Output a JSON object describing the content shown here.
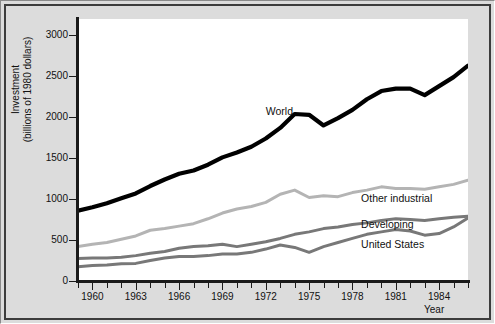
{
  "chart_data": {
    "type": "line",
    "title": "",
    "xlabel": "Year",
    "ylabel": "Investment\n(billions of 1980 dollars)",
    "xlim": [
      1959,
      1986
    ],
    "ylim": [
      0,
      3200
    ],
    "grid": false,
    "legend_position": "inline-right",
    "ytick_labels": [
      "3000",
      "2500",
      "2000",
      "1500",
      "1000",
      "500",
      "0"
    ],
    "ytick_values": [
      3000,
      2500,
      2000,
      1500,
      1000,
      500,
      0
    ],
    "xtick_labels": [
      "1960",
      "1963",
      "1966",
      "1969",
      "1972",
      "1975",
      "1978",
      "1981",
      "1984"
    ],
    "xtick_values": [
      1960,
      1963,
      1966,
      1969,
      1972,
      1975,
      1978,
      1981,
      1984
    ],
    "x": [
      1959,
      1960,
      1961,
      1962,
      1963,
      1964,
      1965,
      1966,
      1967,
      1968,
      1969,
      1970,
      1971,
      1972,
      1973,
      1974,
      1975,
      1976,
      1977,
      1978,
      1979,
      1980,
      1981,
      1982,
      1983,
      1984,
      1985,
      1986
    ],
    "series": [
      {
        "name": "World",
        "color": "#000000",
        "width": 4.2,
        "values": [
          860,
          900,
          950,
          1010,
          1070,
          1160,
          1240,
          1310,
          1350,
          1420,
          1510,
          1570,
          1640,
          1740,
          1870,
          2040,
          2030,
          1900,
          1990,
          2090,
          2220,
          2320,
          2350,
          2350,
          2270,
          2380,
          2490,
          2630
        ]
      },
      {
        "name": "Other industrial",
        "color": "#b4b4b4",
        "width": 3.0,
        "values": [
          420,
          450,
          470,
          510,
          550,
          620,
          640,
          670,
          700,
          760,
          830,
          880,
          910,
          960,
          1060,
          1110,
          1020,
          1040,
          1030,
          1080,
          1110,
          1150,
          1130,
          1130,
          1120,
          1150,
          1180,
          1230
        ]
      },
      {
        "name": "Developing",
        "color": "#787878",
        "width": 3.0,
        "values": [
          275,
          280,
          280,
          290,
          310,
          340,
          360,
          400,
          420,
          430,
          450,
          420,
          450,
          480,
          520,
          570,
          600,
          640,
          660,
          690,
          710,
          740,
          760,
          750,
          740,
          760,
          780,
          790
        ]
      },
      {
        "name": "United States",
        "color": "#787878",
        "width": 3.0,
        "values": [
          175,
          190,
          195,
          210,
          215,
          250,
          280,
          300,
          300,
          310,
          330,
          330,
          350,
          390,
          440,
          410,
          350,
          420,
          470,
          520,
          570,
          600,
          630,
          610,
          560,
          580,
          660,
          770
        ]
      }
    ],
    "annotations": [
      {
        "text": "World",
        "x": 1972.0,
        "y": 2070,
        "anchor": "start"
      },
      {
        "text": "Other industrial",
        "x": 1978.6,
        "y": 1005,
        "anchor": "start"
      },
      {
        "text": "Developing",
        "x": 1978.6,
        "y": 690,
        "anchor": "start"
      },
      {
        "text": "United States",
        "x": 1978.6,
        "y": 440,
        "anchor": "start"
      }
    ]
  }
}
